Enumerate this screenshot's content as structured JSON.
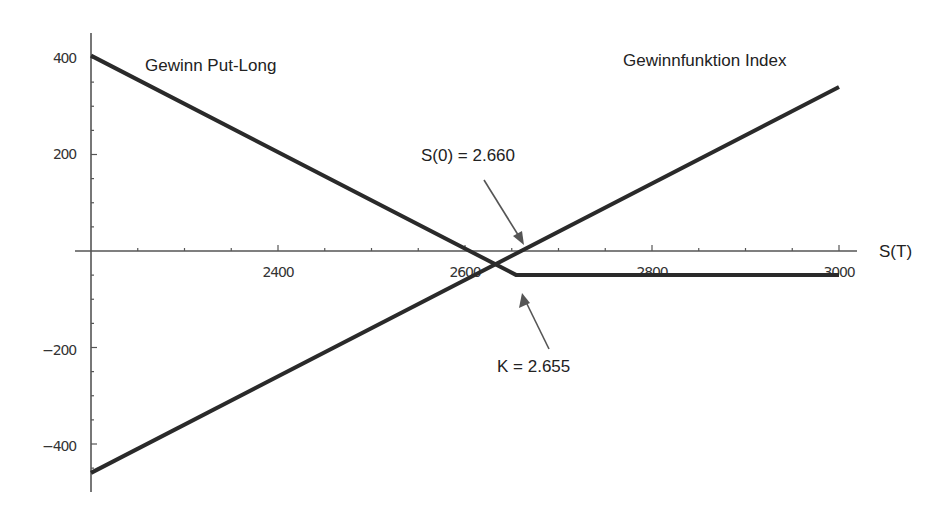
{
  "chart_data": {
    "type": "line",
    "title": "",
    "xlabel": "S(T)",
    "ylabel": "",
    "xlim": [
      2200,
      3000
    ],
    "ylim": [
      -475,
      450
    ],
    "x_ticks": [
      2400,
      2600,
      2800,
      3000
    ],
    "x_minor_step": 50,
    "y_ticks": [
      400,
      200,
      -200,
      -400
    ],
    "y_minor_step": 50,
    "grid": false,
    "series": [
      {
        "name": "Gewinn Put-Long",
        "x": [
          2200,
          2655,
          3000
        ],
        "values": [
          405,
          -50,
          -50
        ]
      },
      {
        "name": "Gewinnfunktion Index",
        "x": [
          2200,
          3000
        ],
        "values": [
          -460,
          340
        ]
      }
    ],
    "annotations": [
      {
        "text": "Gewinn Put-Long",
        "target": "put-long series"
      },
      {
        "text": "Gewinnfunktion Index",
        "target": "index series"
      },
      {
        "text": "S(0) = 2.660",
        "points_to": [
          2660,
          0
        ]
      },
      {
        "text": "K = 2.655",
        "points_to": [
          2655,
          -50
        ]
      }
    ]
  },
  "labels": {
    "x_axis": "S(T)",
    "put_series": "Gewinn Put-Long",
    "index_series": "Gewinnfunktion Index",
    "s0": "S(0) = 2.660",
    "k": "K = 2.655",
    "y_tick_labels": [
      "400",
      "200",
      "−200",
      "−400"
    ],
    "x_tick_labels": [
      "2400",
      "2600",
      "2800",
      "3000"
    ]
  },
  "colors": {
    "line": "#2a2a2a",
    "axis": "#555555",
    "text": "#222222",
    "background": "#ffffff"
  }
}
